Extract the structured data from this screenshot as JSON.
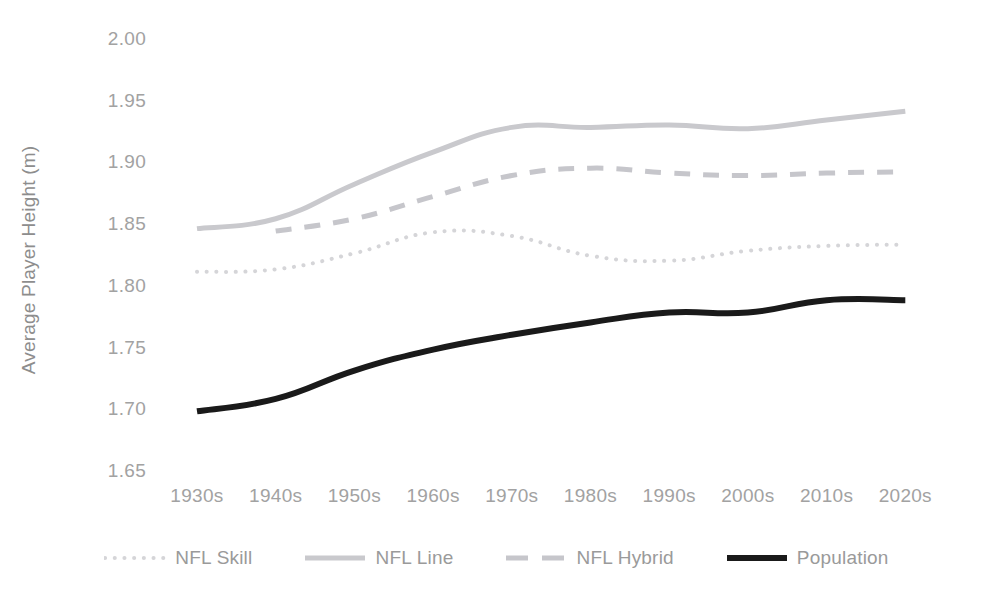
{
  "chart_data": {
    "type": "line",
    "title": "",
    "xlabel": "",
    "ylabel": "Average Player Height (m)",
    "categories": [
      "1930s",
      "1940s",
      "1950s",
      "1960s",
      "1970s",
      "1980s",
      "1990s",
      "2000s",
      "2010s",
      "2020s"
    ],
    "ylim": [
      1.65,
      2.0
    ],
    "yticks": [
      "1.65",
      "1.70",
      "1.75",
      "1.80",
      "1.85",
      "1.90",
      "1.95",
      "2.00"
    ],
    "ytick_values": [
      1.65,
      1.7,
      1.75,
      1.8,
      1.85,
      1.9,
      1.95,
      2.0
    ],
    "grid": false,
    "legend_position": "bottom",
    "series": [
      {
        "name": "NFL Skill",
        "style": "dotted",
        "color": "#d5d5d8",
        "width": 4,
        "values": [
          1.813,
          1.815,
          1.828,
          1.845,
          1.842,
          1.826,
          1.822,
          1.83,
          1.834,
          1.835
        ]
      },
      {
        "name": "NFL Line",
        "style": "solid",
        "color": "#c9c9cd",
        "width": 5,
        "values": [
          1.848,
          1.856,
          1.884,
          1.91,
          1.93,
          1.93,
          1.932,
          1.929,
          1.936,
          1.943
        ]
      },
      {
        "name": "NFL Hybrid",
        "style": "dashed",
        "color": "#c6c6cb",
        "width": 5,
        "values": [
          null,
          1.846,
          1.856,
          1.874,
          1.891,
          1.897,
          1.893,
          1.891,
          1.893,
          1.894
        ]
      },
      {
        "name": "Population",
        "style": "solid",
        "color": "#1a1a1a",
        "width": 6,
        "values": [
          1.7,
          1.71,
          1.733,
          1.75,
          1.762,
          1.772,
          1.78,
          1.78,
          1.79,
          1.79
        ]
      }
    ]
  },
  "legend": {
    "items": [
      {
        "label": "NFL Skill"
      },
      {
        "label": "NFL Line"
      },
      {
        "label": "NFL Hybrid"
      },
      {
        "label": "Population"
      }
    ]
  }
}
